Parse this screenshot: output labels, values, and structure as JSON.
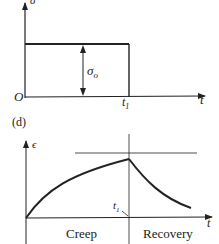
{
  "top_panel": {
    "y_axis_label": "σ",
    "x_axis_label": "t",
    "origin_label": "O",
    "t1_label": "t",
    "t1_sub": "1",
    "stress_label": "σ",
    "stress_sub": "o"
  },
  "panel_label": "(d)",
  "bottom_panel": {
    "y_axis_label": "ϵ",
    "x_axis_label": "t",
    "t1_label": "t",
    "t1_sub": "1",
    "region_left": "Creep",
    "region_right": "Recovery"
  },
  "colors": {
    "line": "#222222",
    "background": "#ffffff"
  }
}
